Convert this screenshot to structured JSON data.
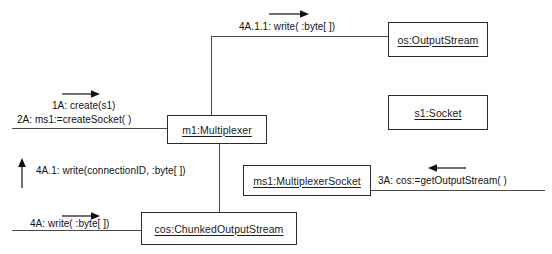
{
  "diagram": {
    "type": "uml-communication-diagram",
    "colors": {
      "line": "#4a4a4a",
      "box_border": "#2b2b2b",
      "text": "#111111",
      "background": "#ffffff"
    },
    "objects": [
      {
        "id": "os",
        "label": "os:OutputStream"
      },
      {
        "id": "s1",
        "label": "s1:Socket"
      },
      {
        "id": "m1",
        "label": "m1:Multiplexer"
      },
      {
        "id": "ms1",
        "label": "ms1:MultiplexerSocket"
      },
      {
        "id": "cos",
        "label": "cos:ChunkedOutputStream"
      }
    ],
    "messages": [
      {
        "id": "msg-4A-1-1",
        "label": "4A.1.1: write( :byte[ ])",
        "direction": "right"
      },
      {
        "id": "msg-1A",
        "label": "1A: create(s1)",
        "direction": "right"
      },
      {
        "id": "msg-2A",
        "label": "2A: ms1:=createSocket( )",
        "direction": "right"
      },
      {
        "id": "msg-4A-1",
        "label": "4A.1: write(connectionID,  :byte[ ])",
        "direction": "up"
      },
      {
        "id": "msg-3A",
        "label": "3A: cos:=getOutputStream( )",
        "direction": "left"
      },
      {
        "id": "msg-4A",
        "label": "4A: write( :byte[ ])",
        "direction": "right"
      }
    ]
  }
}
